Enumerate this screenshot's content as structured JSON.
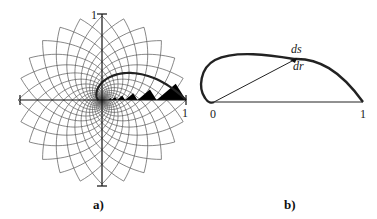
{
  "figure_a": {
    "caption": "a)",
    "labels": {
      "y_axis_top": "1",
      "x_axis_right": "1"
    },
    "grid": {
      "families": 2,
      "curves_per_family": 24,
      "type": "logarithmic-spiral-grid"
    },
    "colors": {
      "grid": "#555555",
      "axis": "#111111",
      "highlight_curve": "#222222",
      "filled_triangles": "#000000"
    }
  },
  "figure_b": {
    "caption": "b)",
    "labels": {
      "origin": "0",
      "end": "1",
      "ds": "ds",
      "dr": "dr"
    },
    "colors": {
      "curve": "#222222",
      "lines": "#222222"
    }
  }
}
